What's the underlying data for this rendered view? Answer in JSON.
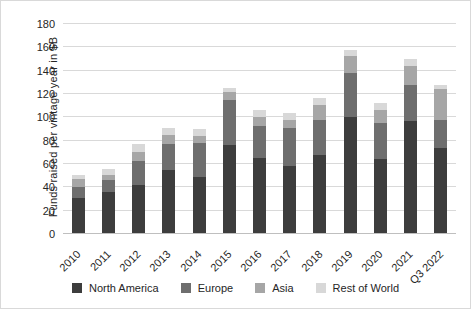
{
  "figure": {
    "background": "#ffffff",
    "border_color": "#d9d9d9",
    "gridline_color": "#d9d9d9"
  },
  "y_axis": {
    "title": "Funds raised per vintage year in $B",
    "ticks": [
      0,
      20,
      40,
      60,
      80,
      100,
      120,
      140,
      160,
      180
    ],
    "max": 180
  },
  "legend": {
    "position": "bottom",
    "items": [
      {
        "label": "North America",
        "color": "#3d3d3d"
      },
      {
        "label": "Europe",
        "color": "#6e6e6e"
      },
      {
        "label": "Asia",
        "color": "#a6a6a6"
      },
      {
        "label": "Rest of World",
        "color": "#d8d8d8"
      }
    ]
  },
  "chart_data": {
    "type": "bar",
    "stacked": true,
    "title": "",
    "xlabel": "",
    "ylabel": "Funds raised per vintage year in $B",
    "ylim": [
      0,
      180
    ],
    "grid": true,
    "legend_position": "bottom",
    "categories": [
      "2010",
      "2011",
      "2012",
      "2013",
      "2014",
      "2015",
      "2016",
      "2017",
      "2018",
      "2019",
      "2020",
      "2021",
      "Q3 2022"
    ],
    "series": [
      {
        "name": "North America",
        "color": "#3d3d3d",
        "values": [
          31,
          36,
          42,
          55,
          49,
          76,
          65,
          58,
          68,
          100,
          64,
          97,
          74
        ]
      },
      {
        "name": "Europe",
        "color": "#6e6e6e",
        "values": [
          9,
          10,
          21,
          22,
          29,
          39,
          28,
          33,
          30,
          38,
          31,
          31,
          24
        ]
      },
      {
        "name": "Asia",
        "color": "#a6a6a6",
        "values": [
          7,
          5,
          7,
          8,
          6,
          7,
          7,
          7,
          13,
          15,
          11,
          16,
          26
        ]
      },
      {
        "name": "Rest of World",
        "color": "#d8d8d8",
        "values": [
          4,
          5,
          7,
          6,
          6,
          3,
          6,
          6,
          6,
          5,
          6,
          6,
          4
        ]
      }
    ],
    "totals": [
      51,
      56,
      77,
      91,
      90,
      125,
      106,
      104,
      117,
      158,
      112,
      150,
      128
    ]
  }
}
